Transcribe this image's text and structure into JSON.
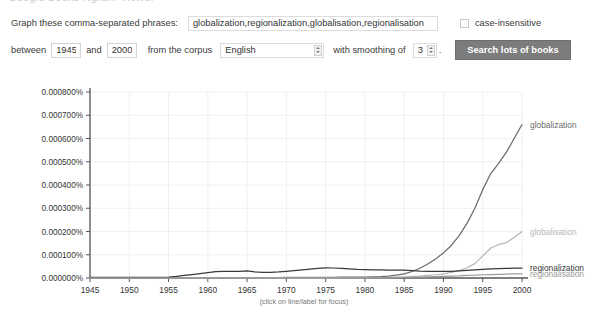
{
  "top_strip": {
    "ghost_text": "Google Books Ngram Viewer"
  },
  "form": {
    "phrases_label": "Graph these comma-separated phrases:",
    "phrases_value": "globalization,regionalization,globalisation,regionalisation",
    "phrases_placeholder": "",
    "case_insensitive_label": "case-insensitive",
    "case_insensitive_checked": false,
    "between_label": "between",
    "year_start": "1945",
    "and_label": "and",
    "year_end": "2000",
    "corpus_label": "from the corpus",
    "corpus_value": "English",
    "smoothing_label": "with smoothing of",
    "smoothing_value": "3",
    "search_button": "Search lots of books",
    "period": "."
  },
  "chart_caption": "(click on line/label for focus)",
  "colors": {
    "globalization": "#6b6b6b",
    "globalisation": "#b6b6b6",
    "regionalization": "#3a3a3a",
    "regionalisation": "#9a9a9a",
    "axis": "#555555",
    "grid": "#f0f0f2",
    "button": "#7c7c7c",
    "text": "#333333"
  },
  "chart_data": {
    "type": "line",
    "title": "",
    "xlabel": "",
    "ylabel": "",
    "xlim": [
      1945,
      2000
    ],
    "ylim": [
      0.0,
      0.0008
    ],
    "grid": true,
    "legend_position": "right-inline-labels",
    "xtick_labels": [
      "1945",
      "1950",
      "1955",
      "1960",
      "1965",
      "1970",
      "1975",
      "1980",
      "1985",
      "1990",
      "1995",
      "2000"
    ],
    "ytick_labels": [
      "0.000000%",
      "0.000100%",
      "0.000200%",
      "0.000300%",
      "0.000400%",
      "0.000500%",
      "0.000600%",
      "0.000700%",
      "0.000800%"
    ],
    "ytick_values": [
      0.0,
      0.0001,
      0.0002,
      0.0003,
      0.0004,
      0.0005,
      0.0006,
      0.0007,
      0.0008
    ],
    "x": [
      1945,
      1946,
      1947,
      1948,
      1949,
      1950,
      1951,
      1952,
      1953,
      1954,
      1955,
      1956,
      1957,
      1958,
      1959,
      1960,
      1961,
      1962,
      1963,
      1964,
      1965,
      1966,
      1967,
      1968,
      1969,
      1970,
      1971,
      1972,
      1973,
      1974,
      1975,
      1976,
      1977,
      1978,
      1979,
      1980,
      1981,
      1982,
      1983,
      1984,
      1985,
      1986,
      1987,
      1988,
      1989,
      1990,
      1991,
      1992,
      1993,
      1994,
      1995,
      1996,
      1997,
      1998,
      1999,
      2000
    ],
    "series": [
      {
        "name": "globalization",
        "color": "#6b6b6b",
        "label_y_value": 0.00066,
        "values": [
          1e-06,
          1e-06,
          1e-06,
          1e-06,
          1e-06,
          1e-06,
          1e-06,
          1e-06,
          1e-06,
          1e-06,
          1e-06,
          1e-06,
          1e-06,
          1e-06,
          1e-06,
          1e-06,
          1e-06,
          1e-06,
          2e-06,
          2e-06,
          2e-06,
          2e-06,
          2e-06,
          2e-06,
          2e-06,
          3e-06,
          3e-06,
          3e-06,
          3e-06,
          3e-06,
          3e-06,
          3e-06,
          4e-06,
          4e-06,
          4e-06,
          4e-06,
          5e-06,
          6e-06,
          8e-06,
          1.2e-05,
          1.8e-05,
          2.8e-05,
          4.2e-05,
          6e-05,
          8.2e-05,
          0.000108,
          0.00014,
          0.000182,
          0.000235,
          0.0003,
          0.00038,
          0.000448,
          0.000492,
          0.00054,
          0.0006,
          0.00066
        ]
      },
      {
        "name": "globalisation",
        "color": "#b6b6b6",
        "label_y_value": 0.0002,
        "values": [
          5e-07,
          5e-07,
          5e-07,
          5e-07,
          5e-07,
          5e-07,
          5e-07,
          5e-07,
          5e-07,
          5e-07,
          5e-07,
          5e-07,
          5e-07,
          5e-07,
          5e-07,
          5e-07,
          5e-07,
          5e-07,
          5e-07,
          5e-07,
          5e-07,
          5e-07,
          5e-07,
          5e-07,
          5e-07,
          6e-07,
          6e-07,
          6e-07,
          6e-07,
          7e-07,
          7e-07,
          8e-07,
          8e-07,
          9e-07,
          1e-06,
          1e-06,
          1.2e-06,
          1.5e-06,
          2e-06,
          3e-06,
          4e-06,
          6e-06,
          8e-06,
          1.1e-05,
          1.4e-05,
          1.8e-05,
          2.4e-05,
          3.2e-05,
          4.4e-05,
          6.2e-05,
          9.5e-05,
          0.000128,
          0.000144,
          0.000152,
          0.000174,
          0.0002
        ]
      },
      {
        "name": "regionalization",
        "color": "#3a3a3a",
        "label_y_value": 4.2e-05,
        "values": [
          3e-06,
          3e-06,
          3e-06,
          3e-06,
          3e-06,
          3e-06,
          3e-06,
          3e-06,
          3e-06,
          3e-06,
          4e-06,
          7e-06,
          1.1e-05,
          1.5e-05,
          1.9e-05,
          2.3e-05,
          2.7e-05,
          2.8e-05,
          2.8e-05,
          2.9e-05,
          3.1e-05,
          2.6e-05,
          2.4e-05,
          2.4e-05,
          2.6e-05,
          2.9e-05,
          3.2e-05,
          3.5e-05,
          3.8e-05,
          4.1e-05,
          4.4e-05,
          4.3e-05,
          4.1e-05,
          3.9e-05,
          3.7e-05,
          3.6e-05,
          3.5e-05,
          3.5e-05,
          3.4e-05,
          3.4e-05,
          3.4e-05,
          3.2e-05,
          3e-05,
          2.9e-05,
          2.8e-05,
          2.8e-05,
          2.9e-05,
          3.1e-05,
          3.3e-05,
          3.5e-05,
          3.7e-05,
          3.9e-05,
          4e-05,
          4.1e-05,
          4.2e-05,
          4.2e-05
        ]
      },
      {
        "name": "regionalisation",
        "color": "#9a9a9a",
        "label_y_value": 1.8e-05,
        "values": [
          4e-07,
          4e-07,
          4e-07,
          4e-07,
          4e-07,
          4e-07,
          4e-07,
          4e-07,
          4e-07,
          4e-07,
          4e-07,
          4e-07,
          4e-07,
          4e-07,
          5e-07,
          5e-07,
          5e-07,
          5e-07,
          5e-07,
          5e-07,
          5e-07,
          5e-07,
          5e-07,
          6e-07,
          6e-07,
          6e-07,
          7e-07,
          7e-07,
          8e-07,
          8e-07,
          9e-07,
          1e-06,
          1e-06,
          1.1e-06,
          1.2e-06,
          1.3e-06,
          1.5e-06,
          1.8e-06,
          2e-06,
          2.5e-06,
          3e-06,
          3.5e-06,
          4e-06,
          5e-06,
          6e-06,
          7e-06,
          8e-06,
          9e-06,
          1.1e-05,
          1.2e-05,
          1.4e-05,
          1.5e-05,
          1.6e-05,
          1.7e-05,
          1.8e-05,
          1.8e-05
        ]
      }
    ],
    "series_labels": [
      {
        "name": "globalization",
        "text": "globalization"
      },
      {
        "name": "globalisation",
        "text": "globalisation"
      },
      {
        "name": "regionalization",
        "text": "regionalization"
      },
      {
        "name": "regionalisation",
        "text": "regionalisation"
      }
    ]
  }
}
